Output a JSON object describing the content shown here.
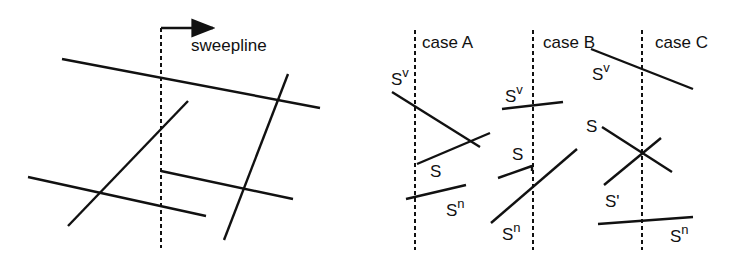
{
  "left_panel": {
    "sweepline_label": "sweepline",
    "sweepline": {
      "x": 161,
      "y1": 28,
      "y2": 248
    },
    "arrow": {
      "x1": 161,
      "y1": 28,
      "x2": 213,
      "y2": 28
    },
    "segments": [
      {
        "x1": 62,
        "y1": 59,
        "x2": 320,
        "y2": 108
      },
      {
        "x1": 288,
        "y1": 74,
        "x2": 224,
        "y2": 240
      },
      {
        "x1": 188,
        "y1": 101,
        "x2": 68,
        "y2": 226
      },
      {
        "x1": 28,
        "y1": 177,
        "x2": 206,
        "y2": 216
      },
      {
        "x1": 161,
        "y1": 171,
        "x2": 293,
        "y2": 199
      }
    ]
  },
  "cases": [
    {
      "title": "case A",
      "sweep_x": 415,
      "labels": {
        "sv_base": "S",
        "sv_sup": "v",
        "s": "S",
        "sn_base": "S",
        "sn_sup": "n"
      },
      "segments": [
        {
          "name": "sv",
          "x1": 392,
          "y1": 92,
          "x2": 480,
          "y2": 147
        },
        {
          "name": "s",
          "x1": 417,
          "y1": 164,
          "x2": 490,
          "y2": 133
        },
        {
          "name": "sn",
          "x1": 406,
          "y1": 199,
          "x2": 466,
          "y2": 185
        }
      ]
    },
    {
      "title": "case B",
      "sweep_x": 533,
      "labels": {
        "sv_base": "S",
        "sv_sup": "v",
        "s": "S",
        "sn_base": "S",
        "sn_sup": "n"
      },
      "segments": [
        {
          "name": "sv",
          "x1": 502,
          "y1": 109,
          "x2": 563,
          "y2": 102
        },
        {
          "name": "s",
          "x1": 498,
          "y1": 178,
          "x2": 532,
          "y2": 166
        },
        {
          "name": "sn",
          "x1": 491,
          "y1": 223,
          "x2": 577,
          "y2": 149
        }
      ]
    },
    {
      "title": "case C",
      "sweep_x": 642,
      "labels": {
        "sv_base": "S",
        "sv_sup": "v",
        "s": "S",
        "s_prime": "S'",
        "sn_base": "S",
        "sn_sup": "n"
      },
      "segments": [
        {
          "name": "sv",
          "x1": 591,
          "y1": 49,
          "x2": 693,
          "y2": 89
        },
        {
          "name": "s",
          "x1": 602,
          "y1": 127,
          "x2": 672,
          "y2": 172
        },
        {
          "name": "s-prime",
          "x1": 604,
          "y1": 185,
          "x2": 661,
          "y2": 138
        },
        {
          "name": "sn",
          "x1": 598,
          "y1": 224,
          "x2": 693,
          "y2": 217
        }
      ]
    }
  ],
  "colors": {
    "line": "#111111",
    "background": "#ffffff"
  }
}
